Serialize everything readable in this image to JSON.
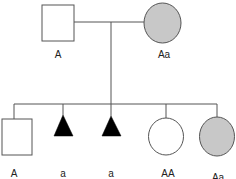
{
  "diagram": {
    "type": "pedigree",
    "colors": {
      "line": "#555555",
      "affected_fill": "#c8c8c8",
      "unaffected_fill": "#ffffff",
      "triangle_fill": "#000000"
    },
    "parents": [
      {
        "id": "father",
        "shape": "square",
        "filled": false,
        "label": "A"
      },
      {
        "id": "mother",
        "shape": "circle",
        "filled": true,
        "label": "Aa"
      }
    ],
    "children": [
      {
        "id": "child-1",
        "shape": "square",
        "filled": false,
        "label": "A"
      },
      {
        "id": "child-2",
        "shape": "triangle",
        "filled": true,
        "label": "a"
      },
      {
        "id": "child-3",
        "shape": "triangle",
        "filled": true,
        "label": "a"
      },
      {
        "id": "child-4",
        "shape": "circle",
        "filled": false,
        "label": "AA"
      },
      {
        "id": "child-5",
        "shape": "circle",
        "filled": true,
        "label": "Aa"
      }
    ]
  }
}
